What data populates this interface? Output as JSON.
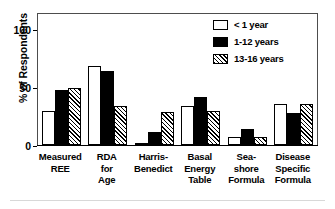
{
  "chart_data": {
    "type": "bar",
    "title": "",
    "subtitle": "",
    "xlabel": "",
    "ylabel": "% of Respondents",
    "ylim": [
      0,
      120
    ],
    "yticks": [
      0,
      50,
      100
    ],
    "ytick_labels": [
      "0",
      "50",
      "100"
    ],
    "grid": false,
    "legend_position": "top-right",
    "categories": [
      "Measured REE",
      "RDA for Age",
      "Harris-Benedict",
      "Basal Energy Table",
      "Sea-shore Formula",
      "Disease Specific Formula"
    ],
    "category_lines": [
      [
        "Measured",
        "REE"
      ],
      [
        "RDA",
        "for",
        "Age"
      ],
      [
        "Harris-",
        "Benedict"
      ],
      [
        "Basal",
        "Energy",
        "Table"
      ],
      [
        "Sea-",
        "shore",
        "Formula"
      ],
      [
        "Disease",
        "Specific",
        "Formula"
      ]
    ],
    "series": [
      {
        "name": "< 1 year",
        "fill": "white",
        "color": "#ffffff",
        "values": [
          31,
          72,
          1,
          36,
          7,
          38
        ]
      },
      {
        "name": "1-12 years",
        "fill": "black",
        "color": "#000000",
        "values": [
          50,
          68,
          12,
          44,
          15,
          29
        ]
      },
      {
        "name": "13-16 years",
        "fill": "hatched",
        "color": "#808080",
        "values": [
          52,
          36,
          30,
          31,
          7,
          38
        ]
      }
    ]
  },
  "axis": {
    "y_title": "% of Respondents",
    "y_tick_0": "0",
    "y_tick_50": "50",
    "y_tick_100": "100"
  },
  "legend": {
    "items": [
      {
        "label": "< 1 year"
      },
      {
        "label": "1-12 years"
      },
      {
        "label": "13-16 years"
      }
    ]
  },
  "xlabels": [
    {
      "l1": "Measured",
      "l2": "REE",
      "l3": ""
    },
    {
      "l1": "RDA",
      "l2": "for",
      "l3": "Age"
    },
    {
      "l1": "Harris-",
      "l2": "Benedict",
      "l3": ""
    },
    {
      "l1": "Basal",
      "l2": "Energy",
      "l3": "Table"
    },
    {
      "l1": "Sea-",
      "l2": "shore",
      "l3": "Formula"
    },
    {
      "l1": "Disease",
      "l2": "Specific",
      "l3": "Formula"
    }
  ]
}
